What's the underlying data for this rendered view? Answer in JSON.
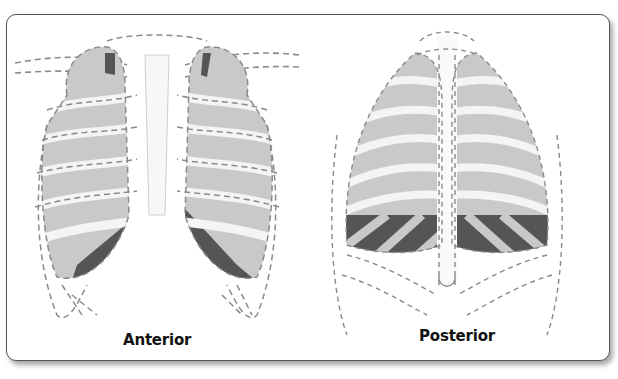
{
  "figure": {
    "panels": [
      {
        "id": "anterior",
        "label": "Anterior"
      },
      {
        "id": "posterior",
        "label": "Posterior"
      }
    ],
    "colors": {
      "lung_fill": "#c9c9c9",
      "shaded_region": "#555555",
      "outline_dash": "#8a8a8a",
      "rib_fill": "#f2f2f2",
      "border": "#555555"
    }
  }
}
